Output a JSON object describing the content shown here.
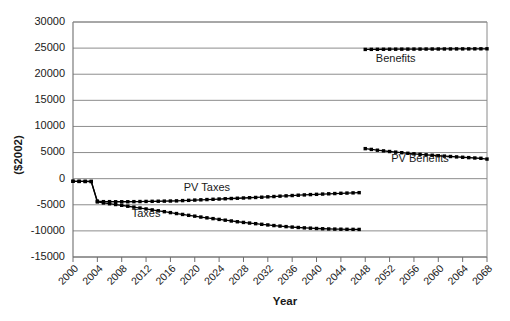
{
  "chart_data": {
    "type": "line",
    "title": "",
    "xlabel": "Year",
    "ylabel": "($2002)",
    "xlim": [
      2000,
      2068
    ],
    "ylim": [
      -15000,
      30000
    ],
    "grid": true,
    "legend": "inline-labels",
    "y_ticks": [
      30000,
      25000,
      20000,
      15000,
      10000,
      5000,
      0,
      -5000,
      -10000,
      -15000
    ],
    "y_tick_labels": [
      "30000",
      "25000",
      "20000",
      "15000",
      "10000",
      "5000",
      "0",
      "-5000",
      "-10000",
      "-15000"
    ],
    "x_ticks": [
      2000,
      2004,
      2008,
      2012,
      2016,
      2020,
      2024,
      2028,
      2032,
      2036,
      2040,
      2044,
      2048,
      2052,
      2056,
      2060,
      2064,
      2068
    ],
    "x_tick_labels": [
      "2000",
      "2004",
      "2008",
      "2012",
      "2016",
      "2020",
      "2024",
      "2028",
      "2032",
      "2036",
      "2040",
      "2044",
      "2048",
      "2052",
      "2056",
      "2060",
      "2064",
      "2068"
    ],
    "series": [
      {
        "name": "Benefits",
        "label_x": 2053,
        "label_y": 22300,
        "x": [
          2048,
          2049,
          2050,
          2051,
          2052,
          2053,
          2054,
          2055,
          2056,
          2057,
          2058,
          2059,
          2060,
          2061,
          2062,
          2063,
          2064,
          2065,
          2066,
          2067,
          2068
        ],
        "values": [
          24750,
          24760,
          24770,
          24780,
          24790,
          24795,
          24800,
          24805,
          24810,
          24815,
          24820,
          24825,
          24830,
          24835,
          24840,
          24845,
          24850,
          24855,
          24860,
          24865,
          24870
        ]
      },
      {
        "name": "PV Benefits",
        "label_x": 2057,
        "label_y": 3200,
        "x": [
          2048,
          2049,
          2050,
          2051,
          2052,
          2053,
          2054,
          2055,
          2056,
          2057,
          2058,
          2059,
          2060,
          2061,
          2062,
          2063,
          2064,
          2065,
          2066,
          2067,
          2068
        ],
        "values": [
          5750,
          5600,
          5450,
          5320,
          5200,
          5080,
          4970,
          4860,
          4760,
          4660,
          4570,
          4480,
          4400,
          4320,
          4240,
          4170,
          4100,
          4030,
          3960,
          3900,
          3750
        ]
      },
      {
        "name": "PV Taxes",
        "label_x": 2022,
        "label_y": -2300,
        "x": [
          2000,
          2001,
          2002,
          2003,
          2004,
          2005,
          2006,
          2007,
          2008,
          2009,
          2010,
          2011,
          2012,
          2013,
          2014,
          2015,
          2016,
          2017,
          2018,
          2019,
          2020,
          2021,
          2022,
          2023,
          2024,
          2025,
          2026,
          2027,
          2028,
          2029,
          2030,
          2031,
          2032,
          2033,
          2034,
          2035,
          2036,
          2037,
          2038,
          2039,
          2040,
          2041,
          2042,
          2043,
          2044,
          2045,
          2046,
          2047
        ],
        "values": [
          -500,
          -520,
          -530,
          -540,
          -4300,
          -4400,
          -4400,
          -4420,
          -4420,
          -4420,
          -4400,
          -4380,
          -4360,
          -4340,
          -4320,
          -4300,
          -4280,
          -4250,
          -4200,
          -4150,
          -4100,
          -4050,
          -4000,
          -3950,
          -3900,
          -3850,
          -3800,
          -3750,
          -3700,
          -3650,
          -3600,
          -3550,
          -3480,
          -3420,
          -3350,
          -3290,
          -3230,
          -3170,
          -3110,
          -3050,
          -3000,
          -2950,
          -2900,
          -2850,
          -2800,
          -2760,
          -2720,
          -2680
        ]
      },
      {
        "name": "Taxes",
        "label_x": 2012,
        "label_y": -7400,
        "x": [
          2000,
          2001,
          2002,
          2003,
          2004,
          2005,
          2006,
          2007,
          2008,
          2009,
          2010,
          2011,
          2012,
          2013,
          2014,
          2015,
          2016,
          2017,
          2018,
          2019,
          2020,
          2021,
          2022,
          2023,
          2024,
          2025,
          2026,
          2027,
          2028,
          2029,
          2030,
          2031,
          2032,
          2033,
          2034,
          2035,
          2036,
          2037,
          2038,
          2039,
          2040,
          2041,
          2042,
          2043,
          2044,
          2045,
          2046,
          2047
        ],
        "values": [
          -500,
          -520,
          -530,
          -540,
          -4450,
          -4650,
          -4800,
          -4950,
          -5100,
          -5280,
          -5450,
          -5620,
          -5800,
          -5980,
          -6150,
          -6320,
          -6500,
          -6680,
          -6850,
          -7020,
          -7180,
          -7350,
          -7500,
          -7650,
          -7800,
          -7950,
          -8100,
          -8250,
          -8380,
          -8500,
          -8620,
          -8740,
          -8860,
          -8980,
          -9080,
          -9180,
          -9270,
          -9350,
          -9420,
          -9480,
          -9540,
          -9590,
          -9630,
          -9660,
          -9680,
          -9700,
          -9710,
          -9720
        ]
      }
    ]
  }
}
